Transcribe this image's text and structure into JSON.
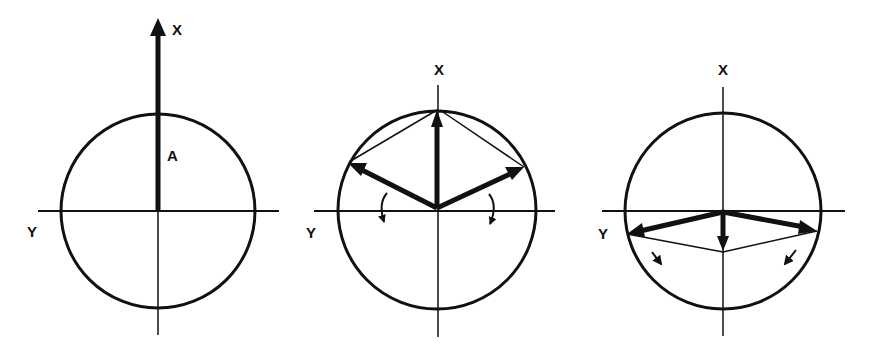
{
  "figures": [
    {
      "id": "panel-1",
      "labels": {
        "x_axis": "X",
        "y_axis": "Y",
        "vector": "A"
      },
      "description": "Single vector A along X axis extending beyond circle"
    },
    {
      "id": "panel-2",
      "labels": {
        "x_axis": "X",
        "y_axis": "Y"
      },
      "description": "Vector along X with two components rotating toward Y axis"
    },
    {
      "id": "panel-3",
      "labels": {
        "x_axis": "X",
        "y_axis": "Y"
      },
      "description": "Components rotated below Y axis with resultant pointing down"
    }
  ],
  "colors": {
    "ink": "#111111",
    "background": "#ffffff"
  }
}
